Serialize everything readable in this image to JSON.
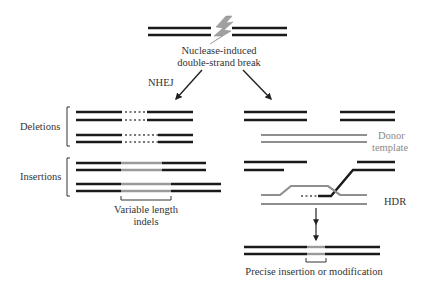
{
  "colors": {
    "dna_strand": "#1a1a1a",
    "donor_strand": "#8f8f8f",
    "inserted_segment": "#9a9a9a",
    "bolt": "#9c9c9c",
    "arrow": "#222222",
    "text": "#333333",
    "donor_text": "#8a8a8a"
  },
  "labels": {
    "break_line1": "Nuclease-induced",
    "break_line2": "double-strand break",
    "nhej": "NHEJ",
    "deletions": "Deletions",
    "insertions": "Insertions",
    "indels_line1": "Variable length",
    "indels_line2": "indels",
    "donor_line1": "Donor",
    "donor_line2": "template",
    "hdr": "HDR",
    "precise": "Precise insertion or modification"
  },
  "icons": {
    "break": "lightning-bolt-icon",
    "nhej_arrow": "arrow-down-left-icon",
    "hdr_arrow": "arrow-down-right-icon",
    "result_arrow": "arrow-down-icon"
  }
}
